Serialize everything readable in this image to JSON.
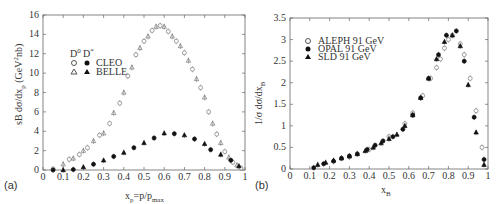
{
  "chart_data": [
    {
      "panel": "(a)",
      "type": "scatter",
      "xlabel": "x_p = p/p_max",
      "ylabel": "sB dσ/dx_p (GeV^2 nb)",
      "xlim": [
        0,
        1
      ],
      "ylim": [
        0,
        16
      ],
      "xticks": [
        "0",
        "0.1",
        "0.2",
        "0.3",
        "0.4",
        "0.5",
        "0.6",
        "0.7",
        "0.8",
        "0.9",
        "1"
      ],
      "yticks": [
        "0",
        "2",
        "4",
        "6",
        "8",
        "10",
        "12",
        "14",
        "16"
      ],
      "legend": {
        "headers": [
          "D0",
          "D*"
        ],
        "rows": [
          {
            "label": "CLEO",
            "d0_marker": "open-circle",
            "dstar_marker": "filled-circle"
          },
          {
            "label": "BELLE",
            "d0_marker": "open-triangle",
            "dstar_marker": "filled-triangle"
          }
        ]
      },
      "series": [
        {
          "name": "D0",
          "marker": "open",
          "x": [
            0.05,
            0.1,
            0.13,
            0.15,
            0.18,
            0.2,
            0.22,
            0.25,
            0.28,
            0.3,
            0.33,
            0.35,
            0.38,
            0.4,
            0.42,
            0.44,
            0.46,
            0.48,
            0.5,
            0.52,
            0.54,
            0.56,
            0.58,
            0.6,
            0.62,
            0.64,
            0.66,
            0.68,
            0.7,
            0.72,
            0.74,
            0.76,
            0.78,
            0.8,
            0.82,
            0.84,
            0.86,
            0.88,
            0.9,
            0.92,
            0.94,
            0.96,
            0.98
          ],
          "y": [
            0.1,
            0.6,
            1.1,
            1.2,
            1.6,
            2.0,
            2.3,
            3.0,
            3.6,
            3.8,
            4.8,
            5.9,
            6.9,
            8.0,
            9.7,
            10.6,
            11.9,
            12.6,
            13.3,
            13.8,
            14.4,
            14.8,
            14.9,
            14.8,
            14.3,
            13.8,
            13.3,
            12.8,
            12.1,
            11.3,
            10.4,
            9.4,
            8.5,
            7.5,
            6.0,
            4.8,
            3.7,
            2.8,
            1.9,
            1.3,
            0.8,
            0.5,
            0.2
          ]
        },
        {
          "name": "D*",
          "marker": "filled",
          "x": [
            0.05,
            0.1,
            0.15,
            0.2,
            0.25,
            0.3,
            0.35,
            0.4,
            0.45,
            0.5,
            0.55,
            0.6,
            0.65,
            0.7,
            0.75,
            0.8,
            0.83,
            0.88,
            0.93,
            0.97
          ],
          "y": [
            0.0,
            0.0,
            0.05,
            0.3,
            0.6,
            1.0,
            1.4,
            1.8,
            2.3,
            2.8,
            3.3,
            3.8,
            3.75,
            3.6,
            3.2,
            2.7,
            2.1,
            1.6,
            1.0,
            0.4
          ]
        }
      ]
    },
    {
      "panel": "(b)",
      "type": "scatter",
      "xlabel": "x_B",
      "ylabel": "1/σ dσ/dx_B",
      "xlim": [
        0,
        1
      ],
      "ylim": [
        0,
        3.5
      ],
      "xticks": [
        "0",
        "0.1",
        "0.2",
        "0.3",
        "0.4",
        "0.5",
        "0.6",
        "0.7",
        "0.8",
        "0.9",
        "1"
      ],
      "yticks": [
        "0",
        "0.5",
        "1",
        "1.5",
        "2",
        "2.5",
        "3",
        "3.5"
      ],
      "legend": [
        {
          "label": "ALEPH 91 GeV",
          "marker": "open-circle"
        },
        {
          "label": "OPAL 91 GeV",
          "marker": "filled-circle"
        },
        {
          "label": "SLD 91 GeV",
          "marker": "filled-triangle"
        }
      ],
      "series": [
        {
          "name": "ALEPH 91 GeV",
          "marker": "open-circle",
          "x": [
            0.3,
            0.4,
            0.5,
            0.58,
            0.62,
            0.67,
            0.71,
            0.74,
            0.76,
            0.78,
            0.8,
            0.82,
            0.86,
            0.88,
            0.91,
            0.94,
            0.97
          ],
          "y": [
            0.28,
            0.45,
            0.75,
            1.05,
            1.3,
            1.7,
            2.1,
            2.35,
            2.55,
            2.8,
            3.0,
            3.1,
            2.9,
            2.65,
            2.1,
            1.35,
            0.5
          ]
        },
        {
          "name": "OPAL 91 GeV",
          "marker": "filled-circle",
          "x": [
            0.12,
            0.17,
            0.22,
            0.26,
            0.3,
            0.34,
            0.39,
            0.43,
            0.47,
            0.52,
            0.57,
            0.62,
            0.66,
            0.7,
            0.75,
            0.79,
            0.84,
            0.88,
            0.93,
            0.98
          ],
          "y": [
            0.03,
            0.12,
            0.18,
            0.25,
            0.3,
            0.35,
            0.45,
            0.55,
            0.65,
            0.75,
            0.92,
            1.25,
            1.65,
            2.1,
            2.65,
            3.1,
            3.2,
            2.5,
            1.2,
            0.22
          ]
        },
        {
          "name": "SLD 91 GeV",
          "marker": "filled-triangle",
          "x": [
            0.14,
            0.18,
            0.22,
            0.26,
            0.3,
            0.34,
            0.38,
            0.42,
            0.46,
            0.5,
            0.54,
            0.58,
            0.62,
            0.66,
            0.7,
            0.74,
            0.78,
            0.82,
            0.86,
            0.9,
            0.94,
            0.98
          ],
          "y": [
            0.1,
            0.15,
            0.2,
            0.25,
            0.3,
            0.35,
            0.42,
            0.5,
            0.6,
            0.7,
            0.8,
            1.0,
            1.25,
            1.65,
            2.1,
            2.55,
            2.95,
            3.1,
            2.85,
            1.95,
            0.85,
            0.1
          ]
        }
      ]
    }
  ],
  "labels": {
    "a": {
      "panel": "(a)",
      "ylabel_main": "sB dσ/dx",
      "ylabel_sub": "p",
      "ylabel_unit": " (GeV",
      "ylabel_sup": "2",
      "ylabel_unit2": "nb)",
      "xlabel_main": "x",
      "xlabel_sub": "p",
      "xlabel_rest": "=p/p",
      "xlabel_sub2": "max",
      "leg_h1": "D",
      "leg_h1_sup": "0",
      "leg_h2": "D",
      "leg_h2_sup": "*",
      "leg_r1": "CLEO",
      "leg_r2": "BELLE"
    },
    "b": {
      "panel": "(b)",
      "ylabel": "1/σ dσ/dx",
      "ylabel_sub": "B",
      "xlabel_main": "x",
      "xlabel_sub": "B",
      "leg1": "ALEPH 91 GeV",
      "leg2": "OPAL 91 GeV",
      "leg3": "SLD 91 GeV"
    }
  }
}
